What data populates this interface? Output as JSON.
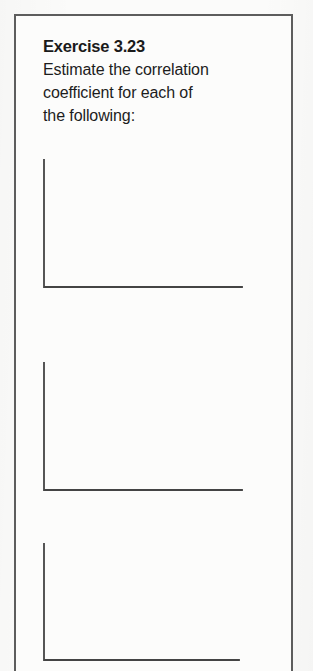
{
  "document": {
    "type": "textbook-exercise",
    "exercise_title": "Exercise 3.23",
    "prompt_lines": [
      "Estimate the correlation",
      "coefficient for each of",
      "the following:"
    ],
    "colors": {
      "page_background": "#fbfbfa",
      "box_border": "#5d5d5d",
      "text": "#1a1a1a",
      "axis": "#444444",
      "dot": "#2b2b2b"
    }
  },
  "chart_data": [
    {
      "id": "scatter-plot-a",
      "type": "scatter",
      "title": "",
      "xlabel": "",
      "ylabel": "",
      "xlim": [
        0,
        100
      ],
      "ylim": [
        0,
        100
      ],
      "grid": false,
      "legend": false,
      "axes_style": "L-shaped (left and bottom spines only)",
      "relationship": "strong negative linear association",
      "points": [
        [
          17,
          92
        ],
        [
          10,
          83
        ],
        [
          24,
          85
        ],
        [
          32,
          82
        ],
        [
          20,
          74
        ],
        [
          30,
          73
        ],
        [
          41,
          75
        ],
        [
          37,
          65
        ],
        [
          47,
          67
        ],
        [
          54,
          69
        ],
        [
          44,
          57
        ],
        [
          52,
          58
        ],
        [
          61,
          60
        ],
        [
          57,
          49
        ],
        [
          66,
          51
        ],
        [
          71,
          56
        ],
        [
          63,
          41
        ],
        [
          73,
          43
        ],
        [
          80,
          46
        ],
        [
          70,
          33
        ],
        [
          79,
          35
        ],
        [
          86,
          37
        ],
        [
          77,
          25
        ],
        [
          86,
          27
        ],
        [
          93,
          29
        ],
        [
          83,
          17
        ],
        [
          91,
          18
        ]
      ]
    },
    {
      "id": "scatter-plot-b",
      "type": "scatter",
      "title": "",
      "xlabel": "",
      "ylabel": "",
      "xlim": [
        0,
        100
      ],
      "ylim": [
        0,
        100
      ],
      "grid": false,
      "legend": false,
      "axes_style": "L-shaped (left and bottom spines only)",
      "relationship": "no association (correlation near zero)",
      "points": [
        [
          9,
          88
        ],
        [
          31,
          84
        ],
        [
          50,
          86
        ],
        [
          71,
          85
        ],
        [
          36,
          61
        ],
        [
          62,
          57
        ],
        [
          78,
          55
        ],
        [
          92,
          61
        ],
        [
          22,
          35
        ],
        [
          78,
          74
        ],
        [
          28,
          25
        ],
        [
          8,
          17
        ],
        [
          39,
          15
        ],
        [
          56,
          26
        ],
        [
          48,
          33
        ],
        [
          85,
          22
        ],
        [
          71,
          12
        ]
      ]
    },
    {
      "id": "scatter-plot-c",
      "type": "scatter",
      "title": "",
      "xlabel": "",
      "ylabel": "",
      "xlim": [
        0,
        100
      ],
      "ylim": [
        0,
        100
      ],
      "grid": false,
      "legend": false,
      "axes_style": "L-shaped (left and bottom spines only)",
      "relationship": "strong positive linear association",
      "points": [
        [
          12,
          21
        ],
        [
          22,
          25
        ],
        [
          31,
          22
        ],
        [
          17,
          11
        ],
        [
          26,
          10
        ],
        [
          26,
          36
        ],
        [
          35,
          32
        ],
        [
          45,
          30
        ],
        [
          33,
          45
        ],
        [
          42,
          44
        ],
        [
          52,
          41
        ],
        [
          39,
          55
        ],
        [
          49,
          53
        ],
        [
          58,
          50
        ],
        [
          46,
          64
        ],
        [
          56,
          62
        ],
        [
          65,
          59
        ],
        [
          62,
          72
        ],
        [
          72,
          70
        ],
        [
          80,
          67
        ],
        [
          69,
          82
        ],
        [
          79,
          83
        ],
        [
          88,
          81
        ]
      ]
    }
  ]
}
